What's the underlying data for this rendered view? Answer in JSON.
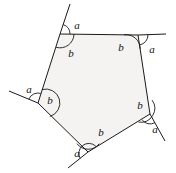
{
  "figure": {
    "name": "pentagon-exterior-angles-diagram",
    "fill_color": "#f4f3f1",
    "stroke_color": "#1a1a1a",
    "background_color": "#ffffff",
    "stroke_width": 1,
    "vertices": [
      {
        "id": "top-left",
        "x": 60,
        "y": 34
      },
      {
        "id": "top-right",
        "x": 138,
        "y": 35
      },
      {
        "id": "right",
        "x": 150,
        "y": 114
      },
      {
        "id": "bottom",
        "x": 88,
        "y": 152
      },
      {
        "id": "left",
        "x": 38,
        "y": 103
      }
    ],
    "extensions": [
      {
        "id": "ext-top-left-up",
        "from": "top-left",
        "to_x": 70,
        "to_y": 4
      },
      {
        "id": "ext-top-right",
        "from": "top-right",
        "to_x": 166,
        "to_y": 34
      },
      {
        "id": "ext-right-down",
        "from": "right",
        "to_x": 165,
        "to_y": 141
      },
      {
        "id": "ext-bottom-left",
        "from": "bottom",
        "to_x": 68,
        "to_y": 168
      },
      {
        "id": "ext-left-upleft",
        "from": "left",
        "to_x": 9,
        "to_y": 91
      }
    ],
    "labels": [
      {
        "id": "a-top-left",
        "text": "a",
        "x": 77,
        "y": 25
      },
      {
        "id": "b-top-left",
        "text": "b",
        "x": 71,
        "y": 53
      },
      {
        "id": "b-top-right",
        "text": "b",
        "x": 121,
        "y": 47
      },
      {
        "id": "a-top-right",
        "text": "a",
        "x": 152,
        "y": 49
      },
      {
        "id": "a-left",
        "text": "a",
        "x": 29,
        "y": 89
      },
      {
        "id": "b-left",
        "text": "b",
        "x": 50,
        "y": 100
      },
      {
        "id": "b-right",
        "text": "b",
        "x": 140,
        "y": 105
      },
      {
        "id": "a-right",
        "text": "a",
        "x": 155,
        "y": 129
      },
      {
        "id": "b-bottom",
        "text": "b",
        "x": 101,
        "y": 132
      },
      {
        "id": "a-bottom",
        "text": "a",
        "x": 77,
        "y": 153
      }
    ]
  }
}
